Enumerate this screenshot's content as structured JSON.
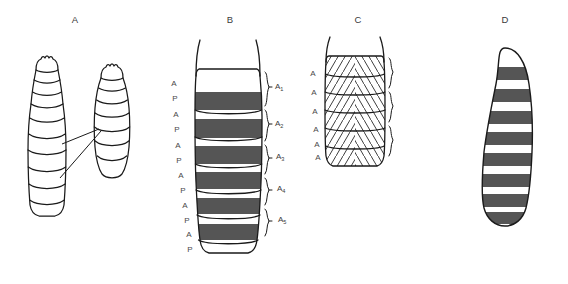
{
  "figure": {
    "background_color": "#ffffff",
    "ink_color": "#1a1a1a",
    "band_fill_color": "#555555",
    "width": 568,
    "height": 284
  },
  "panels": [
    {
      "id": "A",
      "label": "A",
      "label_x": 75,
      "label_y": 20,
      "caption": "Two whole larvae, outlined body segments, leader lines between them"
    },
    {
      "id": "B",
      "label": "B",
      "label_x": 230,
      "label_y": 20,
      "caption": "Segmented body column with alternating dark posterior bands and A/P compartment labels"
    },
    {
      "id": "C",
      "label": "C",
      "label_x": 358,
      "label_y": 20,
      "caption": "Segmented column with chevron hatching and six anterior labels"
    },
    {
      "id": "D",
      "label": "D",
      "label_x": 505,
      "label_y": 20,
      "caption": "Teardrop outline with eight dark transverse bands"
    }
  ],
  "panel_b": {
    "compartment_labels": [
      {
        "text": "A",
        "x": 174,
        "y": 85
      },
      {
        "text": "P",
        "x": 175,
        "y": 100
      },
      {
        "text": "A",
        "x": 176,
        "y": 116
      },
      {
        "text": "P",
        "x": 177,
        "y": 131
      },
      {
        "text": "A",
        "x": 178,
        "y": 147
      },
      {
        "text": "P",
        "x": 179,
        "y": 162
      },
      {
        "text": "A",
        "x": 181,
        "y": 177
      },
      {
        "text": "P",
        "x": 183,
        "y": 192
      },
      {
        "text": "A",
        "x": 185,
        "y": 207
      },
      {
        "text": "P",
        "x": 187,
        "y": 222
      },
      {
        "text": "A",
        "x": 189,
        "y": 236
      },
      {
        "text": "P",
        "x": 190,
        "y": 251
      }
    ],
    "segment_brackets": [
      {
        "text": "A",
        "sub": "1",
        "x": 275,
        "y": 88
      },
      {
        "text": "A",
        "sub": "2",
        "x": 275,
        "y": 125
      },
      {
        "text": "A",
        "sub": "3",
        "x": 276,
        "y": 152
      },
      {
        "text": "A",
        "sub": "4",
        "x": 277,
        "y": 186
      },
      {
        "text": "A",
        "sub": "5",
        "x": 278,
        "y": 212
      }
    ]
  },
  "panel_c": {
    "compartment_labels": [
      {
        "text": "A",
        "x": 313,
        "y": 75
      },
      {
        "text": "A",
        "x": 314,
        "y": 94
      },
      {
        "text": "A",
        "x": 315,
        "y": 113
      },
      {
        "text": "A",
        "x": 316,
        "y": 131
      },
      {
        "text": "A",
        "x": 317,
        "y": 146
      },
      {
        "text": "A",
        "x": 318,
        "y": 159
      }
    ]
  }
}
